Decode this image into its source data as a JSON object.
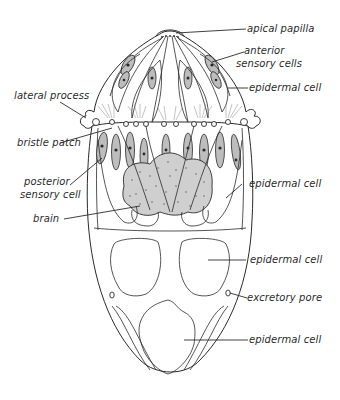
{
  "figure": {
    "background": "#ffffff",
    "ink_color": "#2a2a2a",
    "labels": [
      {
        "id": "apical-papilla",
        "text": "apical papilla",
        "side": "right"
      },
      {
        "id": "anterior-sensory-cells",
        "text": "anterior sensory cells",
        "lines": [
          "anterior",
          "sensory cells"
        ],
        "side": "right"
      },
      {
        "id": "epidermal-cell-1",
        "text": "epidermal cell",
        "side": "right"
      },
      {
        "id": "lateral-process",
        "text": "lateral process",
        "side": "left"
      },
      {
        "id": "bristle-patch",
        "text": "bristle patch",
        "side": "left"
      },
      {
        "id": "posterior-sensory-cell",
        "text": "posterior sensory cell",
        "lines": [
          "posterior",
          "sensory cell"
        ],
        "side": "left"
      },
      {
        "id": "brain",
        "text": "brain",
        "side": "left"
      },
      {
        "id": "epidermal-cell-2",
        "text": "epidermal cell",
        "side": "right"
      },
      {
        "id": "epidermal-cell-3",
        "text": "epidermal cell",
        "side": "right"
      },
      {
        "id": "excretory-pore",
        "text": "excretory pore",
        "side": "right"
      },
      {
        "id": "epidermal-cell-4",
        "text": "epidermal cell",
        "side": "right"
      }
    ]
  },
  "labels": {
    "apical_papilla": "apical papilla",
    "anterior_1": "anterior",
    "anterior_2": "sensory cells",
    "epidermal_1": "epidermal cell",
    "lateral_process": "lateral process",
    "bristle_patch": "bristle patch",
    "posterior_1": "posterior",
    "posterior_2": "sensory cell",
    "brain": "brain",
    "epidermal_2": "epidermal cell",
    "epidermal_3": "epidermal cell",
    "excretory_pore": "excretory pore",
    "epidermal_4": "epidermal cell"
  }
}
